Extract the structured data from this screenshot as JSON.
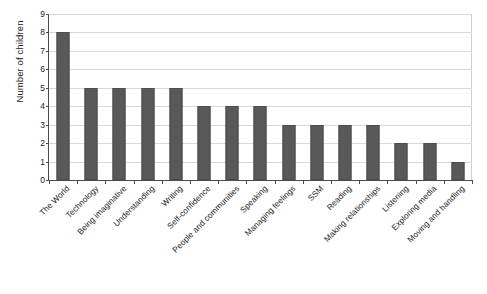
{
  "chart_data": {
    "type": "bar",
    "title": "",
    "xlabel": "",
    "ylabel": "Number of children",
    "ylim": [
      0,
      9
    ],
    "ytick_labels": [
      "0",
      "1",
      "2",
      "3",
      "4",
      "5",
      "6",
      "7",
      "8",
      "9"
    ],
    "grid": true,
    "legend": false,
    "bar_color": "#595959",
    "gridline_color": "#d9d9d9",
    "axis_color": "#4a4a4a",
    "categories": [
      "The World",
      "Technology",
      "Being imaginative",
      "Understanding",
      "Writing",
      "Self-confidence",
      "People and communities",
      "Speaking",
      "Managing feelings",
      "SSM",
      "Reading",
      "Making relationships",
      "Listening",
      "Exploring media",
      "Moving and handling"
    ],
    "values": [
      8,
      5,
      5,
      5,
      5,
      4,
      4,
      4,
      3,
      3,
      3,
      3,
      2,
      2,
      1
    ]
  }
}
